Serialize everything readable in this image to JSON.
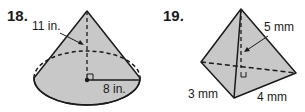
{
  "problems": [
    {
      "number": "18.",
      "shape": "cone",
      "labels": {
        "height": "11 in.",
        "radius": "8 in."
      }
    },
    {
      "number": "19.",
      "shape": "triangular-pyramid",
      "labels": {
        "height": "5 mm",
        "base_leg_a": "3 mm",
        "base_leg_b": "4 mm"
      }
    }
  ],
  "colors": {
    "fill": "#c8c8c8",
    "stroke": "#1a1a1a",
    "background": "#ffffff"
  }
}
